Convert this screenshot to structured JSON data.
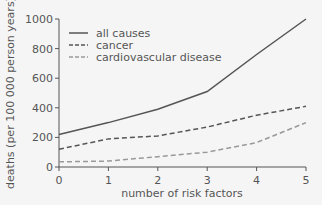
{
  "chart_data": {
    "type": "line",
    "title": "",
    "xlabel": "number of risk factors",
    "ylabel": "deaths (per 100 000 person years)",
    "x": [
      0,
      1,
      2,
      3,
      4,
      5
    ],
    "xticks": [
      "0",
      "1",
      "2",
      "3",
      "4",
      "5"
    ],
    "yticks": [
      "0",
      "200",
      "400",
      "600",
      "800",
      "1000"
    ],
    "ylim": [
      0,
      1000
    ],
    "xlim": [
      0,
      5
    ],
    "grid": false,
    "legend_position": "upper-left",
    "series": [
      {
        "name": "all causes",
        "style": "solid",
        "color": "#555555",
        "values": [
          220,
          300,
          390,
          510,
          760,
          1000
        ]
      },
      {
        "name": "cancer",
        "style": "dashed",
        "color": "#555555",
        "values": [
          120,
          190,
          210,
          270,
          350,
          410
        ]
      },
      {
        "name": "cardiovascular disease",
        "style": "dashed",
        "color": "#999999",
        "values": [
          35,
          40,
          70,
          100,
          165,
          300
        ]
      }
    ]
  }
}
